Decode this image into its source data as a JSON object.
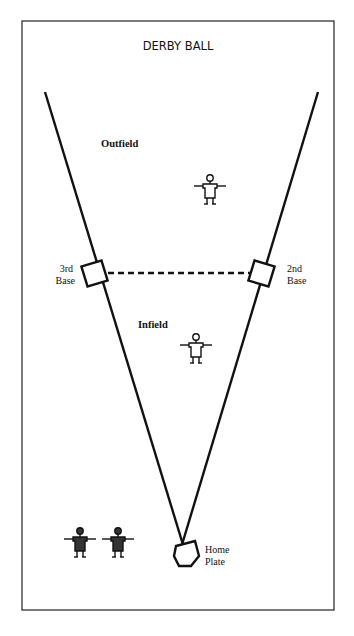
{
  "diagram": {
    "title": "DERBY BALL",
    "labels": {
      "outfield": "Outfield",
      "infield": "Infield",
      "third_base": [
        "3rd",
        "Base"
      ],
      "second_base": [
        "2nd",
        "Base"
      ],
      "home_plate": [
        "Home",
        "Plate"
      ]
    },
    "players": [
      {
        "role": "outfield-fielder",
        "team": "fielding",
        "fill": "#ffffff"
      },
      {
        "role": "infield-fielder",
        "team": "fielding",
        "fill": "#ffffff"
      },
      {
        "role": "batting-player-1",
        "team": "batting",
        "fill": "#333333"
      },
      {
        "role": "batting-player-2",
        "team": "batting",
        "fill": "#333333"
      }
    ],
    "colors": {
      "line": "#111111",
      "background": "#ffffff"
    }
  }
}
